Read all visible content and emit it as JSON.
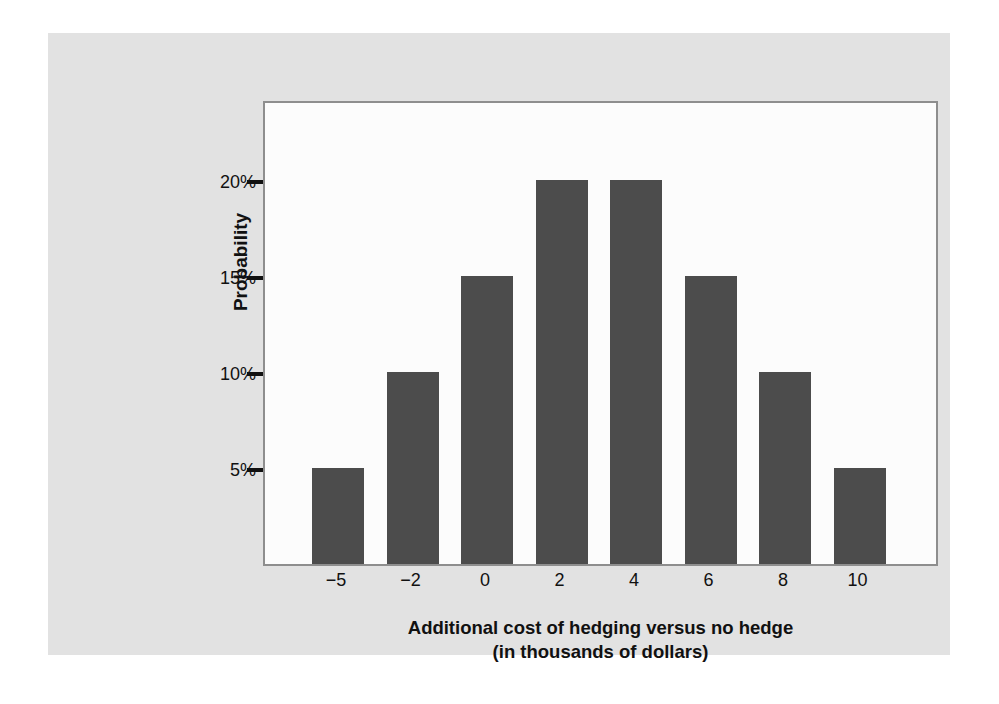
{
  "figure": {
    "panel_background": "#e2e2e2",
    "page_background": "#ffffff",
    "plot_background": "#fcfcfc",
    "frame_color": "#8e8e8e",
    "bar_color": "#4c4c4c",
    "text_color": "#111111",
    "y_axis_title": "Probability",
    "caption_line1": "Additional cost of hedging versus no hedge",
    "caption_line2": "(in thousands of dollars)"
  },
  "chart_data": {
    "type": "bar",
    "title": "Additional cost of hedging versus no hedge (in thousands of dollars)",
    "xlabel": "Additional cost of hedging versus no hedge (in thousands of dollars)",
    "ylabel": "Probability",
    "categories": [
      "−5",
      "−2",
      "0",
      "2",
      "4",
      "6",
      "8",
      "10"
    ],
    "values": [
      5,
      10,
      15,
      20,
      20,
      15,
      10,
      5
    ],
    "value_labels": [
      "5%",
      "10%",
      "15%",
      "20%",
      "20%",
      "15%",
      "10%",
      "5%"
    ],
    "ylim": [
      0,
      24.2
    ],
    "yticks": [
      5,
      10,
      15,
      20
    ],
    "ytick_labels": [
      "5%",
      "10%",
      "15%",
      "20%"
    ],
    "grid": false,
    "legend": "none",
    "bar_color": "#4c4c4c",
    "units": "percent"
  }
}
